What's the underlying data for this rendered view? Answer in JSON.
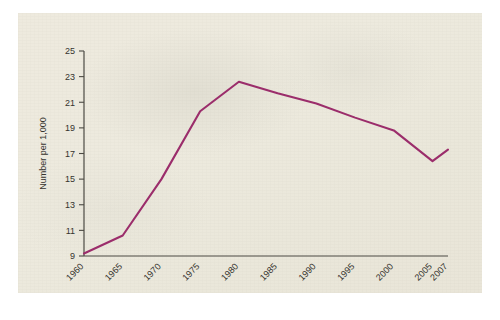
{
  "chart_data": {
    "type": "line",
    "title": "",
    "subtitle": "",
    "xlabel": "",
    "ylabel": "Number per 1,000",
    "x": [
      1960,
      1965,
      1970,
      1975,
      1980,
      1985,
      1990,
      1995,
      2000,
      2005,
      2007
    ],
    "categories": [
      "1960",
      "1965",
      "1970",
      "1975",
      "1980",
      "1985",
      "1990",
      "1995",
      "2000",
      "2005",
      "2007"
    ],
    "values": [
      9.2,
      10.6,
      15.0,
      20.3,
      22.6,
      21.7,
      20.9,
      19.8,
      18.8,
      16.4,
      17.3
    ],
    "series": [
      {
        "name": "Number per 1,000",
        "color": "#9b2d6b",
        "values": [
          9.2,
          10.6,
          15.0,
          20.3,
          22.6,
          21.7,
          20.9,
          19.8,
          18.8,
          16.4,
          17.3
        ]
      }
    ],
    "ylim": [
      9,
      25
    ],
    "ytick_step": 2,
    "yticks": [
      9,
      11,
      13,
      15,
      17,
      19,
      21,
      23,
      25
    ],
    "ytick_labels": [
      "9",
      "11",
      "13",
      "15",
      "17",
      "19",
      "21",
      "23",
      "25"
    ],
    "xticks": [
      1960,
      1965,
      1970,
      1975,
      1980,
      1985,
      1990,
      1995,
      2000,
      2005,
      2007
    ],
    "xtick_labels": [
      "1960",
      "1965",
      "1970",
      "1975",
      "1980",
      "1985",
      "1990",
      "1995",
      "2000",
      "2005",
      "2007"
    ],
    "xtick_label_rotation": -45,
    "xlim": [
      1960,
      2007
    ],
    "grid": false,
    "legend": false,
    "legend_position": "none",
    "annotations": [],
    "line_color": "#9b2d6b",
    "axis_color": "#4c4a44",
    "background_color": "#ebe8db"
  }
}
